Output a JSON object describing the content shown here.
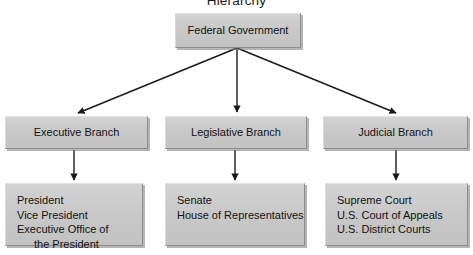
{
  "title": "Hierarchy",
  "diagram": {
    "type": "org-chart",
    "root": {
      "label": "Federal Government"
    },
    "branches": [
      {
        "label": "Executive Branch",
        "members": [
          "President",
          "Vice President",
          "Executive Office of",
          "the President"
        ]
      },
      {
        "label": "Legislative Branch",
        "members": [
          "Senate",
          "House of Representatives"
        ]
      },
      {
        "label": "Judicial Branch",
        "members": [
          "Supreme Court",
          "U.S. Court of Appeals",
          "U.S. District Courts"
        ]
      }
    ]
  },
  "colors": {
    "box_fill": "#c9c9c9",
    "box_shadow": "#787878",
    "text": "#121212",
    "connector": "#1a1a1a",
    "background": "#ffffff"
  }
}
